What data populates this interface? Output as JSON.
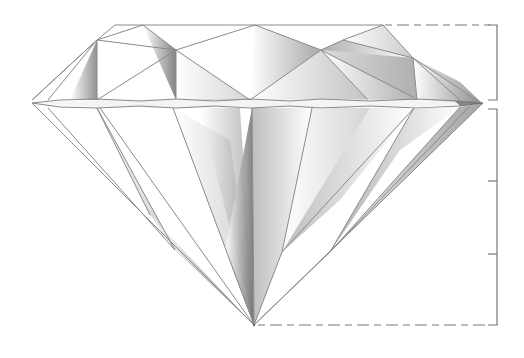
{
  "diagram": {
    "parts": [
      "crown",
      "girdle",
      "pavilion",
      "culet",
      "table"
    ],
    "labels": [],
    "colors": {
      "background": "#ffffff",
      "edge": "#8a8a8a",
      "shade_dark": "#6e6e6e",
      "shade_light": "#ffffff",
      "bracket": "#777777"
    },
    "geometry": {
      "table": {
        "x1": 115,
        "x2": 383,
        "y": 25
      },
      "girdle": {
        "left_x": 32,
        "right_x": 483,
        "top_y": 100,
        "bottom_y": 107
      },
      "culet": {
        "x": 254,
        "y": 325
      },
      "crown_height_bracket": {
        "x": 497,
        "top_y": 25,
        "bottom_y": 100
      },
      "pavilion_depth_bracket": {
        "x": 497,
        "top_y": 109,
        "bottom_y": 325,
        "ticks_y": [
          181,
          254
        ]
      }
    }
  }
}
